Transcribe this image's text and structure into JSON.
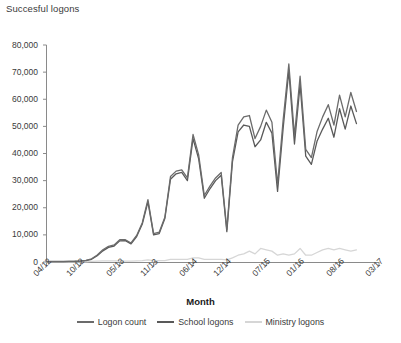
{
  "chart_data": {
    "type": "line",
    "title": "Succesful logons",
    "xlabel": "Month",
    "ylabel": "",
    "ylim": [
      0,
      80000
    ],
    "ytick_labels": [
      "80,000",
      "70,000",
      "60,000",
      "50,000",
      "40,000",
      "30,000",
      "20,000",
      "10,000",
      "0"
    ],
    "ytick_values": [
      80000,
      70000,
      60000,
      50000,
      40000,
      30000,
      20000,
      10000,
      0
    ],
    "xtick_labels": [
      "04/12",
      "10/12",
      "05/13",
      "11/13",
      "06/14",
      "12/14",
      "07/15",
      "01/16",
      "08/16",
      "03/17"
    ],
    "xtick_index": [
      0,
      6,
      13,
      19,
      26,
      32,
      39,
      45,
      52,
      59
    ],
    "grid": false,
    "legend_position": "bottom",
    "x": [
      "04/12",
      "05/12",
      "06/12",
      "07/12",
      "08/12",
      "09/12",
      "10/12",
      "11/12",
      "12/12",
      "01/13",
      "02/13",
      "03/13",
      "04/13",
      "05/13",
      "06/13",
      "07/13",
      "08/13",
      "09/13",
      "10/13",
      "11/13",
      "12/13",
      "01/14",
      "02/14",
      "03/14",
      "04/14",
      "05/14",
      "06/14",
      "07/14",
      "08/14",
      "09/14",
      "10/14",
      "11/14",
      "12/14",
      "01/15",
      "02/15",
      "03/15",
      "04/15",
      "05/15",
      "06/15",
      "07/15",
      "08/15",
      "09/15",
      "10/15",
      "11/15",
      "12/15",
      "01/16",
      "02/16",
      "03/16",
      "04/16",
      "05/16",
      "06/16",
      "07/16",
      "08/16",
      "09/16",
      "10/16",
      "11/16"
    ],
    "series": [
      {
        "name": "Logon count",
        "color": "#6b6b6b",
        "values": [
          200,
          200,
          200,
          200,
          250,
          300,
          400,
          600,
          1200,
          2600,
          4500,
          5800,
          6300,
          8200,
          8200,
          7000,
          9800,
          14500,
          23000,
          10500,
          11000,
          16500,
          31500,
          33500,
          34000,
          31000,
          47000,
          39500,
          24500,
          28000,
          31000,
          33000,
          12000,
          38500,
          50500,
          53500,
          54000,
          45500,
          50000,
          56000,
          51500,
          28500,
          52500,
          73000,
          46500,
          68500,
          41500,
          38500,
          48000,
          53500,
          58000,
          50500,
          61500,
          53500,
          62500,
          55500
        ]
      },
      {
        "name": "School logons",
        "color": "#595959",
        "values": [
          150,
          150,
          150,
          150,
          200,
          250,
          350,
          500,
          1000,
          2300,
          4100,
          5400,
          5900,
          7800,
          7900,
          6700,
          9400,
          14000,
          22200,
          10000,
          10500,
          16000,
          30500,
          32500,
          33000,
          30000,
          45500,
          38000,
          23500,
          27000,
          30000,
          32000,
          11200,
          37000,
          48000,
          50500,
          50000,
          42500,
          45000,
          51500,
          47500,
          26000,
          49500,
          70500,
          43500,
          65500,
          39000,
          36000,
          44500,
          49000,
          53000,
          46000,
          56500,
          49000,
          57500,
          51000
        ]
      },
      {
        "name": "Ministry logons",
        "color": "#d6d6d6",
        "values": [
          50,
          50,
          50,
          50,
          50,
          50,
          50,
          100,
          200,
          300,
          400,
          400,
          400,
          400,
          300,
          300,
          400,
          500,
          800,
          500,
          500,
          500,
          1000,
          1000,
          1000,
          1000,
          1500,
          1500,
          1000,
          1000,
          1000,
          1000,
          800,
          1500,
          2500,
          3000,
          4000,
          3000,
          5000,
          4500,
          4000,
          2500,
          3000,
          2500,
          3000,
          5000,
          2500,
          2500,
          3500,
          4500,
          5000,
          4500,
          5000,
          4500,
          4000,
          4500
        ]
      }
    ]
  },
  "legend": {
    "items": [
      {
        "label": "Logon count",
        "color": "#6b6b6b"
      },
      {
        "label": "School logons",
        "color": "#595959"
      },
      {
        "label": "Ministry logons",
        "color": "#d6d6d6"
      }
    ]
  }
}
